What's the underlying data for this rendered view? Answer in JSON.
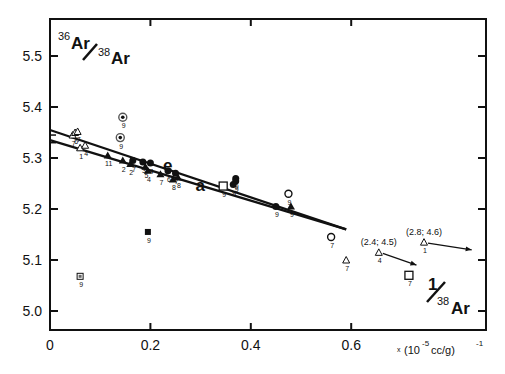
{
  "chart_data": {
    "type": "scatter",
    "title": "",
    "ylabel": "36Ar/38Ar",
    "ylabel_parts": {
      "sup1": "36",
      "base1": "Ar",
      "sup2": "38",
      "base2": "Ar"
    },
    "xlabel": "1/38Ar",
    "xlabel_parts": {
      "num": "1",
      "sup": "38",
      "base": "Ar"
    },
    "x_units": "x (10^-5 cc/g)^-1",
    "x_units_parts": {
      "prefix": "x",
      "open": "(10",
      "exp": "-5",
      "mid": " cc/g)",
      "exp2": "-1"
    },
    "xlim": [
      0,
      0.86
    ],
    "ylim": [
      4.96,
      5.57
    ],
    "x_ticks": [
      "0",
      "0.2",
      "0.4",
      "0.6"
    ],
    "x_tick_values": [
      0,
      0.2,
      0.4,
      0.6
    ],
    "y_ticks": [
      "5.0",
      "5.1",
      "5.2",
      "5.3",
      "5.4",
      "5.5"
    ],
    "y_tick_values": [
      5.0,
      5.1,
      5.2,
      5.3,
      5.4,
      5.5
    ],
    "grid": false,
    "legend": null,
    "lines": [
      {
        "name": "e",
        "x": [
          0,
          0.59
        ],
        "y": [
          5.355,
          5.16
        ]
      },
      {
        "name": "a",
        "x": [
          0,
          0.59
        ],
        "y": [
          5.335,
          5.16
        ]
      }
    ],
    "line_labels": [
      {
        "text": "e",
        "x": 0.225,
        "y": 5.275
      },
      {
        "text": "a",
        "x": 0.29,
        "y": 5.235
      }
    ],
    "series": [
      {
        "name": "filled-triangle",
        "marker": "triangle-filled",
        "points": [
          {
            "x": 0.115,
            "y": 5.305,
            "label": "11"
          },
          {
            "x": 0.145,
            "y": 5.295,
            "label": "2"
          },
          {
            "x": 0.16,
            "y": 5.288,
            "label": "2"
          },
          {
            "x": 0.19,
            "y": 5.283,
            "label": "5"
          },
          {
            "x": 0.195,
            "y": 5.275,
            "label": "4"
          },
          {
            "x": 0.22,
            "y": 5.268,
            "label": "7"
          },
          {
            "x": 0.245,
            "y": 5.258,
            "label": "8"
          },
          {
            "x": 0.255,
            "y": 5.262,
            "label": "8"
          },
          {
            "x": 0.48,
            "y": 5.205,
            "label": "9"
          }
        ]
      },
      {
        "name": "filled-circle",
        "marker": "circle-filled",
        "points": [
          {
            "x": 0.165,
            "y": 5.295,
            "label": "7"
          },
          {
            "x": 0.185,
            "y": 5.292,
            "label": "3"
          },
          {
            "x": 0.2,
            "y": 5.29,
            "label": "4"
          },
          {
            "x": 0.235,
            "y": 5.275,
            "label": "6"
          },
          {
            "x": 0.25,
            "y": 5.27,
            "label": "7"
          },
          {
            "x": 0.37,
            "y": 5.26,
            "label": "9"
          },
          {
            "x": 0.37,
            "y": 5.255,
            "label": "9"
          },
          {
            "x": 0.365,
            "y": 5.248,
            "label": "9"
          },
          {
            "x": 0.45,
            "y": 5.205,
            "label": "9"
          }
        ]
      },
      {
        "name": "open-triangle",
        "marker": "triangle-open",
        "points": [
          {
            "x": 0.045,
            "y": 5.345,
            "label": "7"
          },
          {
            "x": 0.05,
            "y": 5.35,
            "label": "6"
          },
          {
            "x": 0.055,
            "y": 5.352,
            "label": "7"
          },
          {
            "x": 0.06,
            "y": 5.32,
            "label": "1"
          },
          {
            "x": 0.07,
            "y": 5.325,
            "label": "4"
          },
          {
            "x": 0.59,
            "y": 5.1,
            "label": "7"
          },
          {
            "x": 0.655,
            "y": 5.115,
            "label": "4"
          },
          {
            "x": 0.745,
            "y": 5.135,
            "label": "1"
          }
        ]
      },
      {
        "name": "dotted-circle",
        "marker": "circle-dot",
        "points": [
          {
            "x": 0.145,
            "y": 5.38,
            "label": "9"
          },
          {
            "x": 0.14,
            "y": 5.34,
            "label": "9"
          }
        ]
      },
      {
        "name": "open-circle",
        "marker": "circle-open",
        "points": [
          {
            "x": 0.475,
            "y": 5.23,
            "label": "9"
          },
          {
            "x": 0.56,
            "y": 5.145,
            "label": "7"
          }
        ]
      },
      {
        "name": "open-square",
        "marker": "square-open",
        "points": [
          {
            "x": 0.345,
            "y": 5.245,
            "label": "9"
          },
          {
            "x": 0.715,
            "y": 5.07,
            "label": "7"
          }
        ]
      },
      {
        "name": "filled-square",
        "marker": "square-filled",
        "points": [
          {
            "x": 0.195,
            "y": 5.155,
            "label": "9"
          }
        ]
      },
      {
        "name": "crossed-square",
        "marker": "square-cross",
        "points": [
          {
            "x": 0.06,
            "y": 5.068,
            "label": "9"
          }
        ]
      }
    ],
    "annotations": [
      {
        "text": "(2.4; 4.5)",
        "x": 0.655,
        "y": 5.115,
        "arrow_to": [
          0.73,
          5.09
        ]
      },
      {
        "text": "(2.8; 4.6)",
        "x": 0.745,
        "y": 5.135,
        "arrow_to": [
          0.84,
          5.12
        ]
      }
    ]
  }
}
